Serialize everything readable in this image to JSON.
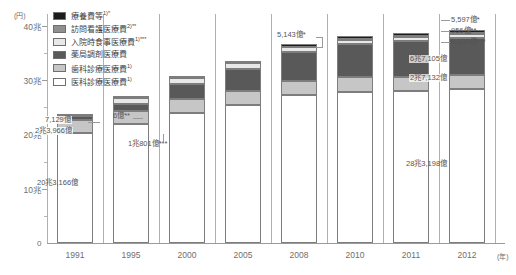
{
  "chart_data": {
    "type": "bar",
    "stacked": true,
    "title": "",
    "xlabel": "(年)",
    "ylabel": "(円)",
    "ylim": [
      0,
      42
    ],
    "y_unit_label": "(円)",
    "y_ticks": [
      "40兆",
      "30兆",
      "20兆",
      "10兆"
    ],
    "y_tick_values": [
      40,
      30,
      20,
      10
    ],
    "y_minor_values": [
      35,
      25,
      15,
      5
    ],
    "zero_label": "0",
    "grid": false,
    "legend_position": "top-left",
    "categories": [
      "1991",
      "1995",
      "2000",
      "2005",
      "2008",
      "2010",
      "2011",
      "2012"
    ],
    "series": [
      {
        "name": "医科診療医療費",
        "name_sup": "1)",
        "color": "#ffffff",
        "values": [
          20.3166,
          22.0,
          24.0,
          25.4,
          27.2,
          27.9,
          28.0,
          28.3198
        ]
      },
      {
        "name": "歯科診療医療費",
        "name_sup": "1)",
        "color": "#c6c6c6",
        "values": [
          2.3966,
          2.4,
          2.5,
          2.55,
          2.6,
          2.65,
          2.68,
          2.7132
        ]
      },
      {
        "name": "薬局調剤医療費",
        "name_sup": "",
        "color": "#595959",
        "values": [
          0.7129,
          1.3,
          2.8,
          4.2,
          5.4,
          6.1,
          6.5,
          6.7105
        ]
      },
      {
        "name": "入院時食事医療費",
        "name_sup": "1)***",
        "color": "#e8e8e8",
        "values": [
          0.0,
          1.0801,
          1.0801,
          0.95,
          0.85,
          0.82,
          0.82,
          0.813
        ]
      },
      {
        "name": "訪問看護医療費",
        "name_sup": "2)**",
        "color": "#8f8f8f",
        "values": [
          0.0006,
          0.02,
          0.03,
          0.04,
          0.05,
          0.07,
          0.085,
          0.0956
        ]
      },
      {
        "name": "療養費等",
        "name_sup": "1)*",
        "color": "#1c1c1c",
        "values": [
          0.15,
          0.2,
          0.3,
          0.42,
          0.5143,
          0.54,
          0.55,
          0.5597
        ]
      }
    ],
    "totals": [
      23.58,
      27.0,
      30.71,
      33.56,
      36.61,
      38.08,
      38.64,
      39.2118
    ]
  },
  "legend": {
    "items": [
      {
        "label": "療養費等",
        "sup": "1)*",
        "swatch": "#1c1c1c",
        "name": "legend-ryouyouhi"
      },
      {
        "label": "訪問看護医療費",
        "sup": "2)**",
        "swatch": "#8f8f8f",
        "name": "legend-houmonkango"
      },
      {
        "label": "入院時食事医療費",
        "sup": "1)***",
        "swatch": "#e8e8e8",
        "name": "legend-nyuinjishokuji"
      },
      {
        "label": "薬局調剤医療費",
        "sup": "",
        "swatch": "#595959",
        "name": "legend-yakkyokuchouzai"
      },
      {
        "label": "歯科診療医療費",
        "sup": "1)",
        "swatch": "#c6c6c6",
        "name": "legend-shika"
      },
      {
        "label": "医科診療医療費",
        "sup": "1)",
        "swatch": "#ffffff",
        "name": "legend-ika"
      }
    ]
  },
  "annotations": {
    "y1991_yakkyoku": "7,129億",
    "y1991_shika": "2兆3,966億",
    "y1991_ika": "20兆3,166億",
    "y1995_houmon": "6億**",
    "y2000_shokuji": "1兆801億***",
    "y2008_ryouyou": "5,143億*",
    "y2012_ryouyou": "5,597億*",
    "y2012_houmon": "956億**",
    "y2012_shokuji": "8,130億***",
    "y2012_yakkyoku": "6兆7,105億",
    "y2012_shika": "2兆7,132億",
    "y2012_ika": "28兆3,198億"
  }
}
